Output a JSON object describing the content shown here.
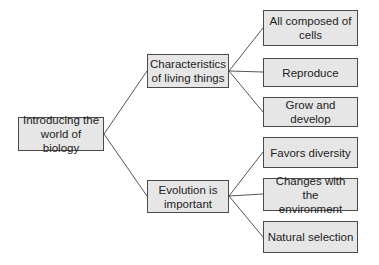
{
  "diagram": {
    "type": "tree",
    "root": {
      "label": "Introducing the world of biology",
      "line1": "Introducing the",
      "line2": "world of biology"
    },
    "branches": [
      {
        "label": "Characteristics of living things",
        "line1": "Characteristics",
        "line2": "of living things",
        "children": [
          {
            "label": "All composed of cells",
            "line1": "All composed of",
            "line2": "cells"
          },
          {
            "label": "Reproduce"
          },
          {
            "label": "Grow and develop"
          }
        ]
      },
      {
        "label": "Evolution is important",
        "line1": "Evolution is",
        "line2": "important",
        "children": [
          {
            "label": "Favors diversity"
          },
          {
            "label": "Changes with the environment",
            "line1": "Changes with the",
            "line2": "environment"
          },
          {
            "label": "Natural selection"
          }
        ]
      }
    ]
  },
  "colors": {
    "box_fill": "#e6e6e6",
    "box_border": "#4a4a4a",
    "line": "#555555"
  }
}
